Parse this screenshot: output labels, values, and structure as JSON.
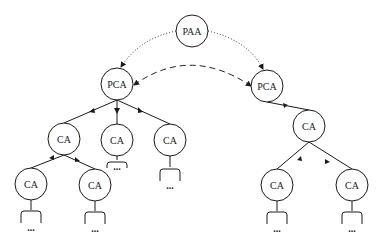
{
  "diagram": {
    "type": "hierarchy-tree",
    "nodes": [
      {
        "id": "paa",
        "label": "PAA",
        "x": 192,
        "y": 31
      },
      {
        "id": "pca_left",
        "label": "PCA",
        "x": 117,
        "y": 84
      },
      {
        "id": "pca_right",
        "label": "PCA",
        "x": 267,
        "y": 86
      },
      {
        "id": "ca_l1",
        "label": "CA",
        "x": 64,
        "y": 139
      },
      {
        "id": "ca_l2",
        "label": "CA",
        "x": 117,
        "y": 140
      },
      {
        "id": "ca_l3",
        "label": "CA",
        "x": 170,
        "y": 140
      },
      {
        "id": "ca_l1a",
        "label": "CA",
        "x": 31,
        "y": 184
      },
      {
        "id": "ca_l1b",
        "label": "CA",
        "x": 95,
        "y": 185
      },
      {
        "id": "ca_r1",
        "label": "CA",
        "x": 309,
        "y": 126
      },
      {
        "id": "ca_r1a",
        "label": "CA",
        "x": 277,
        "y": 185
      },
      {
        "id": "ca_r1b",
        "label": "CA",
        "x": 352,
        "y": 185
      }
    ],
    "edges": [
      {
        "from": "paa",
        "to": "pca_left",
        "style": "dotted"
      },
      {
        "from": "paa",
        "to": "pca_right",
        "style": "dotted"
      },
      {
        "from": "pca_left",
        "to": "pca_right",
        "style": "dashed",
        "bidirectional": true
      },
      {
        "from": "pca_left",
        "to": "ca_l1",
        "style": "solid"
      },
      {
        "from": "pca_left",
        "to": "ca_l2",
        "style": "solid"
      },
      {
        "from": "pca_left",
        "to": "ca_l3",
        "style": "solid"
      },
      {
        "from": "ca_l1",
        "to": "ca_l1a",
        "style": "solid"
      },
      {
        "from": "ca_l1",
        "to": "ca_l1b",
        "style": "solid"
      },
      {
        "from": "pca_right",
        "to": "ca_r1",
        "style": "solid"
      },
      {
        "from": "ca_r1",
        "to": "ca_r1a",
        "style": "solid"
      },
      {
        "from": "ca_r1",
        "to": "ca_r1b",
        "style": "solid"
      }
    ],
    "ellipsis": "..."
  },
  "labels": {
    "paa": "PAA",
    "pca_left": "PCA",
    "pca_right": "PCA",
    "ca_l1": "CA",
    "ca_l2": "CA",
    "ca_l3": "CA",
    "ca_l1a": "CA",
    "ca_l1b": "CA",
    "ca_r1": "CA",
    "ca_r1a": "CA",
    "ca_r1b": "CA",
    "more": "..."
  }
}
